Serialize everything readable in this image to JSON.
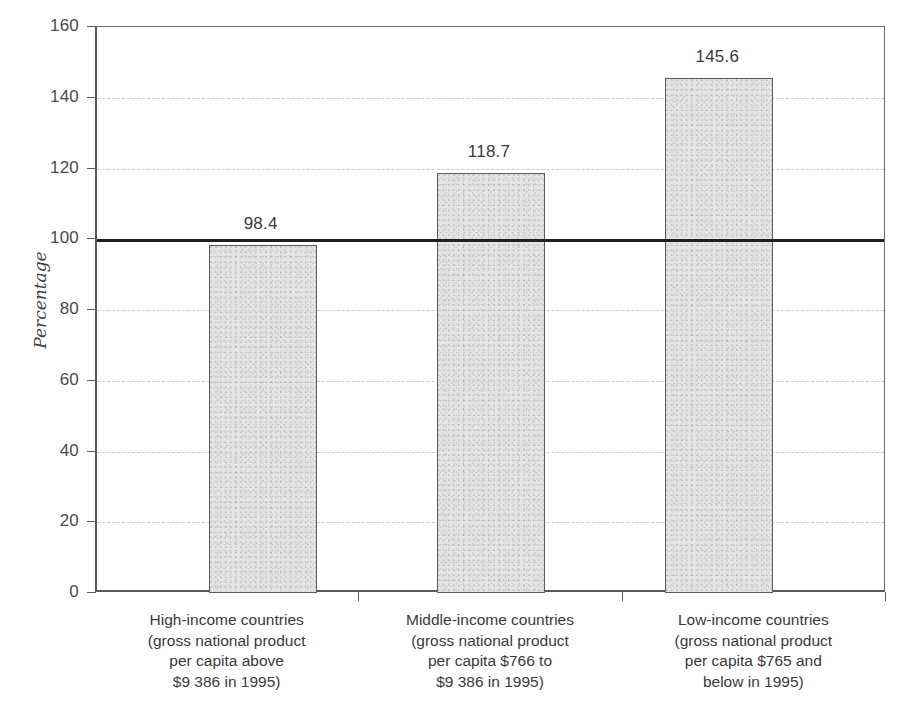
{
  "chart_data": {
    "type": "bar",
    "title": "",
    "subtitle": "",
    "xlabel": "",
    "ylabel": "Percentage",
    "ylim": [
      0,
      160
    ],
    "ytick_values": [
      0,
      20,
      40,
      60,
      80,
      100,
      120,
      140,
      160
    ],
    "ytick_labels": [
      "0",
      "20",
      "40",
      "60",
      "80",
      "100",
      "120",
      "140",
      "160"
    ],
    "grid": true,
    "grid_axis": "y",
    "legend": false,
    "categories": [
      "High-income countries\n(gross national product\nper capita above\n$9 386 in 1995)",
      "Middle-income countries\n(gross national product\nper capita $766 to\n$9 386 in 1995)",
      "Low-income countries\n(gross national product\nper capita $765 and\nbelow in 1995)"
    ],
    "values": [
      98.4,
      118.7,
      145.6
    ],
    "data_labels": [
      "98.4",
      "118.7",
      "145.6"
    ],
    "reference_lines": [
      {
        "value": 100,
        "style": "solid-thick",
        "color": "#1f1f1f"
      }
    ],
    "bar_fill_color": "#e3e3e3",
    "bar_border_color": "#5d5d5d",
    "gridline_color": "#c9c9c9",
    "axis_color": "#5a5a5a",
    "text_color": "#3a3a3a"
  },
  "axis": {
    "y_title": "Percentage"
  }
}
